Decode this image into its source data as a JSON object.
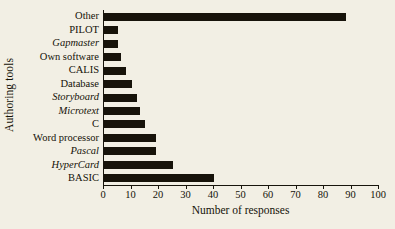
{
  "chart_data": {
    "type": "bar",
    "orientation": "horizontal",
    "title": "",
    "xlabel": "Number of responses",
    "ylabel": "Authoring tools",
    "xlim": [
      0,
      100
    ],
    "xticks": [
      0,
      10,
      20,
      30,
      40,
      50,
      60,
      70,
      80,
      90,
      100
    ],
    "grid": false,
    "legend": false,
    "bar_color": "#17130a",
    "background_color": "#f2efe4",
    "categories": [
      "Other",
      "PILOT",
      "Gapmaster",
      "Own software",
      "CALIS",
      "Database",
      "Storyboard",
      "Microtext",
      "C",
      "Word processor",
      "Pascal",
      "HyperCard",
      "BASIC"
    ],
    "category_styles": [
      "normal",
      "normal",
      "italic",
      "normal",
      "normal",
      "normal",
      "italic",
      "italic",
      "normal",
      "normal",
      "italic",
      "italic",
      "normal"
    ],
    "values": [
      88,
      5,
      5,
      6,
      8,
      10,
      12,
      13,
      15,
      19,
      19,
      25,
      40
    ]
  }
}
